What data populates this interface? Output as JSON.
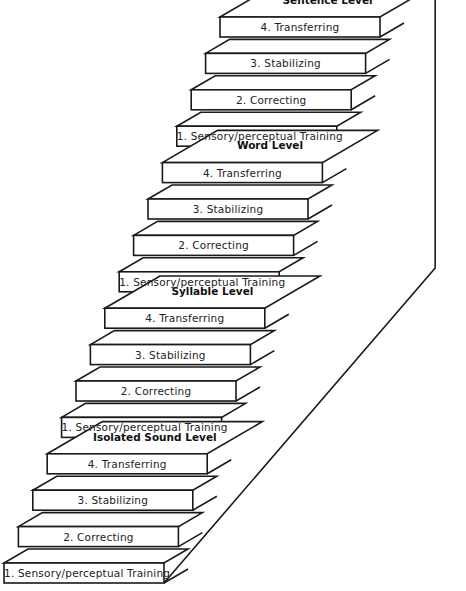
{
  "diagram": {
    "type": "staircase",
    "levels": [
      {
        "name": "Isolated Sound Level",
        "steps": [
          "1. Sensory/perceptual Training",
          "2. Correcting",
          "3. Stabilizing",
          "4. Transferring"
        ]
      },
      {
        "name": "Syllable Level",
        "steps": [
          "1. Sensory/perceptual Training",
          "2. Correcting",
          "3. Stabilizing",
          "4. Transferring"
        ]
      },
      {
        "name": "Word Level",
        "steps": [
          "1. Sensory/perceptual Training",
          "2. Correcting",
          "3. Stabilizing",
          "4. Transferring"
        ]
      },
      {
        "name": "Sentence Level",
        "steps": [
          "1. Sensory/perceptual Training",
          "2. Correcting",
          "3. Stabilizing",
          "4. Transferring"
        ]
      }
    ]
  },
  "colors": {
    "line": "#1a1a1a",
    "background": "#ffffff",
    "text": "#222222"
  }
}
